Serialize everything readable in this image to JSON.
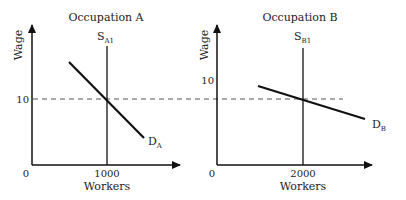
{
  "diagram": {
    "type": "labor-market-supply-demand",
    "reference_line": {
      "wage": "10",
      "style": "dashed"
    },
    "panels": [
      {
        "title": "Occupation A",
        "y_axis_label": "Wage",
        "x_axis_label": "Workers",
        "origin_label": "0",
        "y_tick_label": "10",
        "x_tick_label": "1000",
        "supply_label": {
          "main": "S",
          "sub": "A1"
        },
        "demand_label": {
          "main": "D",
          "sub": "A"
        }
      },
      {
        "title": "Occupation B",
        "y_axis_label": "Wage",
        "x_axis_label": "Workers",
        "origin_label": "0",
        "y_tick_label": "10",
        "x_tick_label": "2000",
        "supply_label": {
          "main": "S",
          "sub": "B1"
        },
        "demand_label": {
          "main": "D",
          "sub": "B"
        }
      }
    ]
  },
  "colors": {
    "line": "#111111",
    "text": "#222222",
    "dash": "#555555",
    "background": "#ffffff"
  }
}
